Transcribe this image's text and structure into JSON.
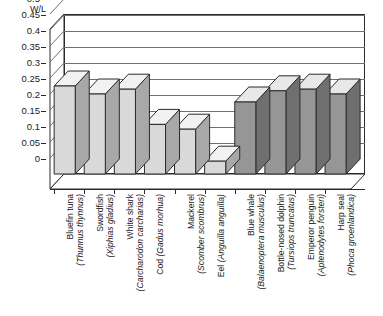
{
  "chart_data": {
    "type": "bar",
    "title": "",
    "subtitle": "",
    "xlabel": "",
    "ylabel": "W/L",
    "ylim": [
      0,
      0.5
    ],
    "ytick_step": 0.05,
    "grid": true,
    "legend": "none",
    "style": "3d-block",
    "ytick_labels": [
      "0.5",
      "0.45",
      "0.4",
      "0.35",
      "0.3",
      "0.25",
      "0.2",
      "0.15",
      "0.1",
      "0.05",
      "0"
    ],
    "ytick_values": [
      0.5,
      0.45,
      0.4,
      0.35,
      0.3,
      0.25,
      0.2,
      0.15,
      0.1,
      0.05,
      0
    ],
    "categories": [
      "Bluefin tuna (Thunnus thynnus)",
      "Swordfish (Xiphias gladius)",
      "White shark (Carcharodon carcharias)",
      "Cod (Gadus morhua)",
      "Mackerel (Scomber scombrus)",
      "Eel (Anguilla anguilla)",
      "Blue whale (Balaenoptera musculus)",
      "Bottle-nosed dolphin (Tursiops truncatus)",
      "Emperor penguin (Aptenodytes forsteri)",
      "Harp seal (Phoca groenlandica)"
    ],
    "values": [
      0.275,
      0.25,
      0.265,
      0.155,
      0.14,
      0.04,
      0.225,
      0.26,
      0.265,
      0.25
    ],
    "bars": [
      {
        "common": "Bluefin tuna",
        "scientific": "(Thunnus thynnus)",
        "value": 0.275,
        "shade": "light"
      },
      {
        "common": "Swordfish",
        "scientific": "(Xiphias gladius)",
        "value": 0.25,
        "shade": "light"
      },
      {
        "common": "White shark",
        "scientific": "(Carcharodon carcharias)",
        "value": 0.265,
        "shade": "light"
      },
      {
        "common": "Cod",
        "scientific": "(Gadus morhua)",
        "value": 0.155,
        "shade": "light",
        "inline": true
      },
      {
        "common": "Mackerel",
        "scientific": "(Scomber scombrus)",
        "value": 0.14,
        "shade": "light"
      },
      {
        "common": "Eel",
        "scientific": "(Anguilla anguilla)",
        "value": 0.04,
        "shade": "light",
        "inline": true
      },
      {
        "common": "Blue whale",
        "scientific": "(Balaenoptera musculus)",
        "value": 0.225,
        "shade": "dark"
      },
      {
        "common": "Bottle-nosed dolphin",
        "scientific": "(Tursiops truncatus)",
        "value": 0.26,
        "shade": "dark"
      },
      {
        "common": "Emperor penguin",
        "scientific": "(Aptenodytes forsteri)",
        "value": 0.265,
        "shade": "dark"
      },
      {
        "common": "Harp seal",
        "scientific": "(Phoca groenlandica)",
        "value": 0.25,
        "shade": "dark"
      }
    ]
  },
  "colors": {
    "light_front": "#d9d9d9",
    "light_side": "#a8a8a8",
    "light_top": "#f2f2f2",
    "dark_front": "#969696",
    "dark_side": "#6f6f6f",
    "dark_top": "#e8e8e8",
    "outline": "#2b2b2b",
    "grid": "#6e6e6e",
    "background": "#ffffff",
    "text": "#1a1a1a"
  }
}
